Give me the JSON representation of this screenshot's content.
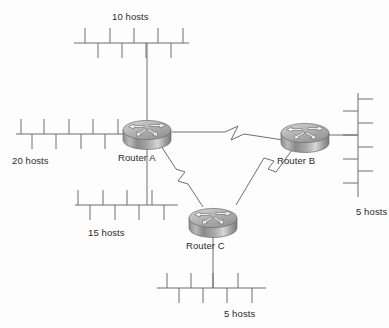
{
  "diagram": {
    "background_color": "#fdfdfd",
    "line_color": "#6e6e6e",
    "text_color": "#2b2b2b",
    "router_body_color": "#9a9a9a",
    "router_top_color": "#bcbcbc"
  },
  "routers": [
    {
      "id": "router-a",
      "label": "Router A",
      "x": 147,
      "y": 131,
      "label_x": 118,
      "label_y": 152
    },
    {
      "id": "router-b",
      "label": "Router B",
      "x": 305,
      "y": 134,
      "label_x": 277,
      "label_y": 155
    },
    {
      "id": "router-c",
      "label": "Router C",
      "x": 213,
      "y": 219,
      "label_x": 186,
      "label_y": 240
    }
  ],
  "segments": [
    {
      "id": "segment-10-hosts",
      "label": "10 hosts",
      "hosts": 10,
      "orientation": "horizontal",
      "label_x": 112,
      "label_y": 11,
      "trunk": {
        "x1": 74,
        "y1": 43,
        "x2": 189,
        "y2": 43
      },
      "connects_to": "router-a"
    },
    {
      "id": "segment-20-hosts",
      "label": "20 hosts",
      "hosts": 20,
      "orientation": "horizontal",
      "label_x": 12,
      "label_y": 155,
      "trunk": {
        "x1": 16,
        "y1": 134,
        "x2": 124,
        "y2": 134
      },
      "connects_to": "router-a"
    },
    {
      "id": "segment-15-hosts",
      "label": "15 hosts",
      "hosts": 15,
      "orientation": "horizontal",
      "label_x": 88,
      "label_y": 227,
      "trunk": {
        "x1": 75,
        "y1": 205,
        "x2": 178,
        "y2": 205
      },
      "connects_to": "router-a"
    },
    {
      "id": "segment-5-hosts-right",
      "label": "5 hosts",
      "hosts": 5,
      "orientation": "vertical",
      "label_x": 356,
      "label_y": 206,
      "trunk": {
        "x1": 358,
        "y1": 93,
        "x2": 358,
        "y2": 196
      },
      "connects_to": "router-b"
    },
    {
      "id": "segment-5-hosts-bottom",
      "label": "5 hosts",
      "hosts": 5,
      "orientation": "horizontal",
      "label_x": 224,
      "label_y": 308,
      "trunk": {
        "x1": 157,
        "y1": 288,
        "x2": 266,
        "y2": 288
      },
      "connects_to": "router-c"
    }
  ],
  "links": [
    {
      "id": "link-a-b",
      "from": "Router A",
      "to": "Router B",
      "type": "serial",
      "symbol": "zigzag"
    },
    {
      "id": "link-a-c",
      "from": "Router A",
      "to": "Router C",
      "type": "serial",
      "symbol": "zigzag"
    },
    {
      "id": "link-b-c",
      "from": "Router B",
      "to": "Router C",
      "type": "serial",
      "symbol": "zigzag"
    }
  ]
}
